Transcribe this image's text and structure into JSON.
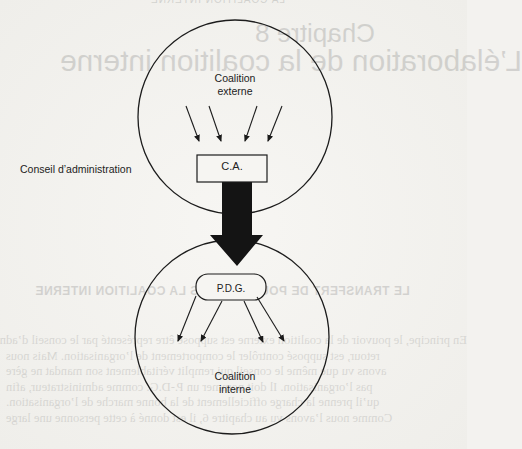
{
  "diagram": {
    "title": "Le transfert de pouvoir vers la coalition interne",
    "nodes": {
      "external_coalition": {
        "label_line1": "Coalition",
        "label_line2": "externe",
        "shape": "circle"
      },
      "board": {
        "label": "C.A.",
        "shape": "rectangle"
      },
      "board_side_label": "Conseil d’administration",
      "ceo": {
        "label": "P.D.G.",
        "shape": "rounded-rectangle"
      },
      "internal_coalition": {
        "label_line1": "Coalition",
        "label_line2": "interne",
        "shape": "circle"
      }
    },
    "edges": [
      {
        "from": "external_coalition",
        "to": "board",
        "count": 4,
        "style": "thin-arrow"
      },
      {
        "from": "board",
        "to": "ceo",
        "count": 1,
        "style": "thick-block-arrow"
      },
      {
        "from": "ceo",
        "to": "internal_coalition",
        "count": 4,
        "style": "thin-arrow"
      }
    ]
  },
  "bleed_through": {
    "header": "LA COALITION INTERNE",
    "chapter": "Chapitre 8",
    "title": "L’élaboration de la coalition interne",
    "section": "LE TRANSFERT DE POUVOIR VERS LA COALITION INTERNE",
    "paragraph": [
      "En principe, le pouvoir de la coalition externe est supposé être représenté par le conseil d’administration, la coalition officielle. Le conseil, en",
      "retour, est supposé contrôler le comportement de l’organisation. Mais nous",
      "avons vu que même le conseil qui remplit véritablement son mandat ne gère",
      "pas l’organisation. Il doit nommer un P.-D.G. comme administrateur, afin",
      "qu’il prenne la charge officiellement de la bonne marche de l’organisation.",
      "Comme nous l’avons vu au chapitre 6, il est donné à cette personne une large"
    ]
  }
}
